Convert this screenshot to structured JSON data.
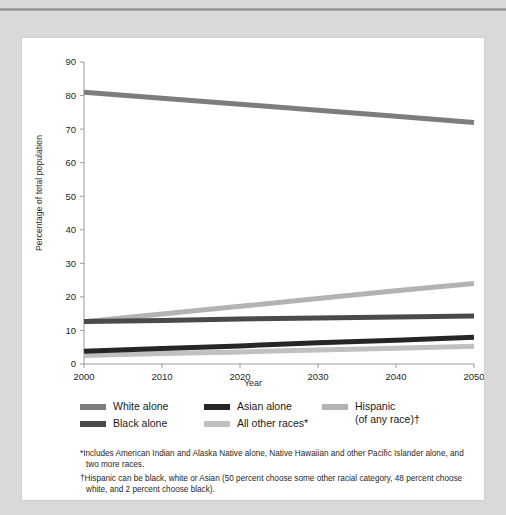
{
  "chart_data": {
    "type": "line",
    "title": "",
    "xlabel": "Year",
    "ylabel": "Percentage of total population",
    "x": [
      2000,
      2010,
      2020,
      2030,
      2040,
      2050
    ],
    "xlim": [
      2000,
      2050
    ],
    "ylim": [
      0,
      90
    ],
    "yticks": [
      0,
      10,
      20,
      30,
      40,
      50,
      60,
      70,
      80,
      90
    ],
    "xticks": [
      2000,
      2010,
      2020,
      2030,
      2040,
      2050
    ],
    "grid": false,
    "legend_position": "below",
    "series": [
      {
        "name": "White alone",
        "color": "#7d7d7d",
        "values": [
          81.0,
          79.2,
          77.4,
          75.6,
          73.8,
          72.0
        ]
      },
      {
        "name": "Black alone",
        "color": "#4a4a4a",
        "values": [
          12.7,
          13.0,
          13.4,
          13.7,
          14.0,
          14.3
        ]
      },
      {
        "name": "Asian alone",
        "color": "#262626",
        "values": [
          3.8,
          4.6,
          5.4,
          6.3,
          7.1,
          8.0
        ]
      },
      {
        "name": "All other races*",
        "color": "#c0c0c0",
        "values": [
          2.5,
          3.1,
          3.6,
          4.2,
          4.7,
          5.3
        ]
      },
      {
        "name": "Hispanic (of any race)",
        "color": "#b3b3b3",
        "values": [
          12.6,
          14.9,
          17.2,
          19.5,
          21.8,
          24.0
        ]
      }
    ]
  },
  "axes": {
    "y_tick_labels": [
      "0",
      "10",
      "20",
      "30",
      "40",
      "50",
      "60",
      "70",
      "80",
      "90"
    ],
    "x_tick_labels": [
      "2000",
      "2010",
      "2020",
      "2030",
      "2040",
      "2050"
    ],
    "x_title": "Year",
    "y_title": "Percentage of total population"
  },
  "legend": {
    "columns": [
      {
        "items": [
          {
            "label": "White alone",
            "color": "#7d7d7d"
          },
          {
            "label": "Black alone",
            "color": "#4a4a4a"
          }
        ]
      },
      {
        "items": [
          {
            "label": "Asian alone",
            "color": "#262626"
          },
          {
            "label": "All other races*",
            "color": "#c0c0c0"
          }
        ]
      },
      {
        "items": [
          {
            "label_line1": "Hispanic",
            "label_line2": "(of any race)†",
            "color": "#b3b3b3"
          }
        ]
      }
    ]
  },
  "footnotes": [
    {
      "marker": "*",
      "text": "Includes American Indian and Alaska Native alone, Native Hawaiian and other Pacific Islander alone, and two more races."
    },
    {
      "marker": "†",
      "text": "Hispanic can be black, white or Asian (50 percent choose some other racial category, 48 percent choose white, and 2 percent choose black)."
    }
  ]
}
